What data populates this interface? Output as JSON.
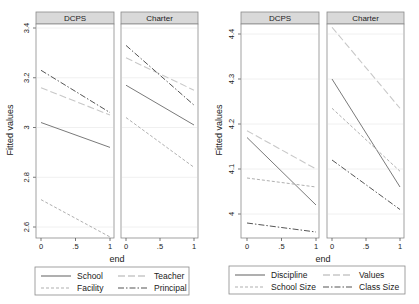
{
  "chart_data": [
    {
      "type": "line",
      "ylabel": "Fitted values",
      "xlabel": "end",
      "ylim": [
        2.55,
        3.44
      ],
      "yticks": [
        2.6,
        2.8,
        3,
        3.2,
        3.4
      ],
      "ytick_labels": [
        "2.6",
        "2.8",
        "3",
        "3.2",
        "3.4"
      ],
      "xticks": [
        0,
        0.5,
        1
      ],
      "xtick_labels": [
        "0",
        ".5",
        "1"
      ],
      "grid": true,
      "legend_position": "bottom",
      "panels": [
        {
          "title": "DCPS",
          "series": [
            {
              "name": "School",
              "x": [
                0,
                1
              ],
              "values": [
                3.02,
                2.92
              ]
            },
            {
              "name": "Teacher",
              "x": [
                0,
                1
              ],
              "values": [
                3.16,
                3.05
              ]
            },
            {
              "name": "Facility",
              "x": [
                0,
                1
              ],
              "values": [
                2.71,
                2.56
              ]
            },
            {
              "name": "Principal",
              "x": [
                0,
                1
              ],
              "values": [
                3.23,
                3.06
              ]
            }
          ]
        },
        {
          "title": "Charter",
          "series": [
            {
              "name": "School",
              "x": [
                0,
                1
              ],
              "values": [
                3.17,
                3.01
              ]
            },
            {
              "name": "Teacher",
              "x": [
                0,
                1
              ],
              "values": [
                3.28,
                3.15
              ]
            },
            {
              "name": "Facility",
              "x": [
                0,
                1
              ],
              "values": [
                3.04,
                2.84
              ]
            },
            {
              "name": "Principal",
              "x": [
                0,
                1
              ],
              "values": [
                3.33,
                3.09
              ]
            }
          ]
        }
      ],
      "legend": [
        {
          "name": "School",
          "style": "solid",
          "color": "#7a7a7a"
        },
        {
          "name": "Teacher",
          "style": "longdash",
          "color": "#c8c8c8"
        },
        {
          "name": "Facility",
          "style": "shortdash",
          "color": "#b0b0b0"
        },
        {
          "name": "Principal",
          "style": "dashdot",
          "color": "#555555"
        }
      ]
    },
    {
      "type": "line",
      "ylabel": "Fitted values",
      "xlabel": "end",
      "ylim": [
        3.95,
        4.44
      ],
      "yticks": [
        4,
        4.1,
        4.2,
        4.3,
        4.4
      ],
      "ytick_labels": [
        "4",
        "4.1",
        "4.2",
        "4.3",
        "4.4"
      ],
      "xticks": [
        0,
        0.5,
        1
      ],
      "xtick_labels": [
        "0",
        ".5",
        "1"
      ],
      "grid": true,
      "legend_position": "bottom",
      "panels": [
        {
          "title": "DCPS",
          "series": [
            {
              "name": "Discipline",
              "x": [
                0,
                1
              ],
              "values": [
                4.17,
                4.02
              ]
            },
            {
              "name": "Values",
              "x": [
                0,
                1
              ],
              "values": [
                4.185,
                4.1
              ]
            },
            {
              "name": "School Size",
              "x": [
                0,
                1
              ],
              "values": [
                4.08,
                4.06
              ]
            },
            {
              "name": "Class Size",
              "x": [
                0,
                1
              ],
              "values": [
                3.98,
                3.96
              ]
            }
          ]
        },
        {
          "title": "Charter",
          "series": [
            {
              "name": "Discipline",
              "x": [
                0,
                1
              ],
              "values": [
                4.3,
                4.06
              ]
            },
            {
              "name": "Values",
              "x": [
                0,
                1
              ],
              "values": [
                4.415,
                4.235
              ]
            },
            {
              "name": "School Size",
              "x": [
                0,
                1
              ],
              "values": [
                4.235,
                4.095
              ]
            },
            {
              "name": "Class Size",
              "x": [
                0,
                1
              ],
              "values": [
                4.12,
                4.01
              ]
            }
          ]
        }
      ],
      "legend": [
        {
          "name": "Discipline",
          "style": "solid",
          "color": "#7a7a7a"
        },
        {
          "name": "Values",
          "style": "longdash",
          "color": "#c8c8c8"
        },
        {
          "name": "School Size",
          "style": "shortdash",
          "color": "#b0b0b0"
        },
        {
          "name": "Class Size",
          "style": "dashdot",
          "color": "#555555"
        }
      ]
    }
  ],
  "layout": [
    {
      "ytickpx": {
        "v0": 2.6,
        "y0": 227,
        "v1": 3.4,
        "y1": 28
      },
      "ylabel_x": 13,
      "ylabel_y": 130,
      "panels": [
        {
          "left": 36,
          "right": 114,
          "x0": 41,
          "x1": 110
        },
        {
          "left": 121,
          "right": 198,
          "x0": 126,
          "x1": 194
        }
      ],
      "header_top": 12,
      "header_bottom": 24,
      "plot_bottom": 238,
      "xlabel_x": 117,
      "xlabel_y": 262,
      "legend": {
        "left": 35,
        "top": 267,
        "width": 154,
        "height": 28
      }
    },
    {
      "ytickpx": {
        "v0": 4.0,
        "y0": 214,
        "v1": 4.4,
        "y1": 34
      },
      "ylabel_x": 222,
      "ylabel_y": 130,
      "panels": [
        {
          "left": 241,
          "right": 319,
          "x0": 247,
          "x1": 316
        },
        {
          "left": 327,
          "right": 404,
          "x0": 332,
          "x1": 400
        }
      ],
      "header_top": 12,
      "header_bottom": 24,
      "plot_bottom": 238,
      "xlabel_x": 323,
      "xlabel_y": 262,
      "legend": {
        "left": 229,
        "top": 266,
        "width": 176,
        "height": 28
      }
    }
  ],
  "style": {
    "header_fill": "#d9d9d9",
    "header_stroke": "#8a8a8a",
    "frame_stroke": "#8a8a8a",
    "grid_color": "#ececec"
  }
}
